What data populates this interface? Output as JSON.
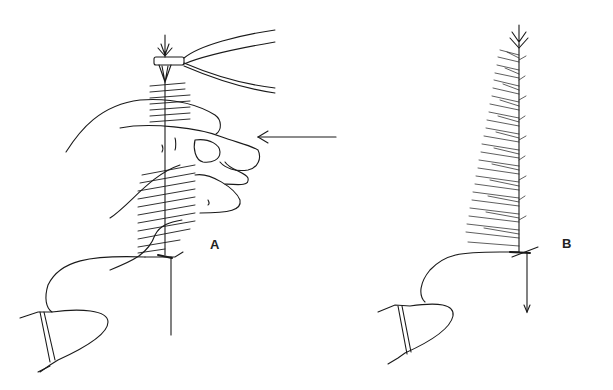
{
  "figure": {
    "panels": [
      {
        "id": "A",
        "label": "A",
        "description": "Hand gathering hackle fibers while hackle pliers hold feather tip above hook in vise; arrow indicates direction of push"
      },
      {
        "id": "B",
        "label": "B",
        "description": "Completed hackle stroked along hook shank with downward arrow"
      }
    ],
    "colors": {
      "ink": "#1a1a1a",
      "background": "#ffffff"
    }
  }
}
